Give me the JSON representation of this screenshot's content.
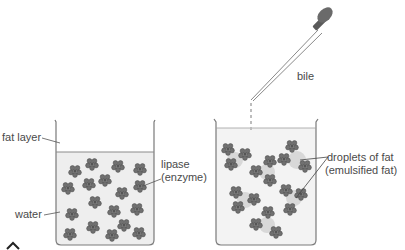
{
  "diagram": {
    "left_beaker": {
      "labels": {
        "fat_layer": "fat layer",
        "water": "water",
        "lipase_line1": "lipase",
        "lipase_line2": "(enzyme)"
      }
    },
    "dropper": {
      "label": "bile"
    },
    "right_beaker": {
      "labels": {
        "droplets_line1": "droplets of fat",
        "droplets_line2": "(emulsified fat)"
      }
    },
    "colors": {
      "outline": "#7a7a7a",
      "water": "#eeeeee",
      "enzyme": "#6e6e6e",
      "fat_droplet": "#d6d6d6",
      "bulb": "#6a6a6a"
    }
  }
}
